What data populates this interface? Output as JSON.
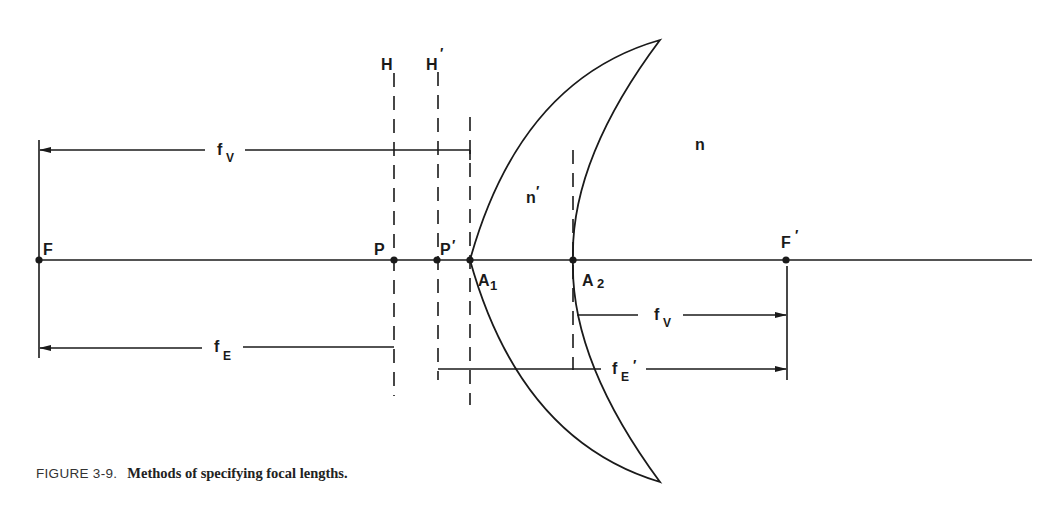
{
  "figure": {
    "caption_number": "FIGURE 3-9.",
    "caption_title": "Methods of specifying focal lengths.",
    "colors": {
      "ink": "#1a1a1a",
      "background": "#ffffff"
    }
  },
  "labels": {
    "H": "H",
    "H_prime": "H",
    "P": "P",
    "P_prime": "P",
    "F": "F",
    "F_prime": "F",
    "A1": "A",
    "A1_sub": "1",
    "A2": "A",
    "A2_sub": "2",
    "n": "n",
    "n_prime": "n",
    "prime": "′",
    "f": "f",
    "fv_sub": "V",
    "fe_sub": "E"
  },
  "dimensions": [
    {
      "name": "front-vertex-focal-length",
      "label": "fV",
      "from": "A1",
      "to": "F",
      "direction": "left"
    },
    {
      "name": "front-effective-focal-length",
      "label": "fE",
      "from": "P",
      "to": "F",
      "direction": "left"
    },
    {
      "name": "back-vertex-focal-length",
      "label": "fV",
      "from": "A2",
      "to": "F'",
      "direction": "right"
    },
    {
      "name": "back-effective-focal-length",
      "label": "fE'",
      "from": "P'",
      "to": "F'",
      "direction": "right"
    }
  ]
}
